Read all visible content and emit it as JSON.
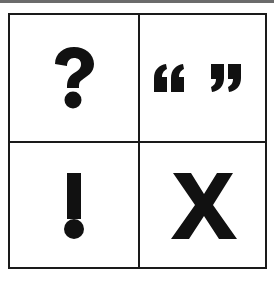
{
  "grid": {
    "rows": 2,
    "cols": 2,
    "cells": [
      {
        "symbol": "?",
        "icon": "question-mark-icon"
      },
      {
        "symbol": "“ ”",
        "icon": "quotation-marks-icon"
      },
      {
        "symbol": "!",
        "icon": "exclamation-mark-icon"
      },
      {
        "symbol": "X",
        "icon": "x-mark-icon"
      }
    ]
  },
  "colors": {
    "ink": "#111111",
    "border": "#1a1a1a",
    "background": "#ffffff"
  }
}
